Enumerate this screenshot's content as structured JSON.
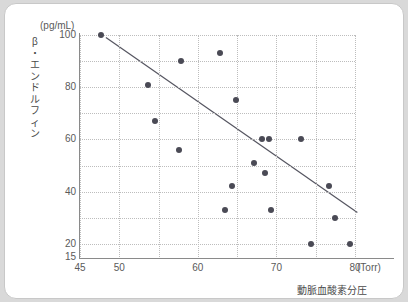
{
  "chart_data": {
    "type": "scatter",
    "title": "",
    "xlabel": "動脈血酸素分圧",
    "xunit": "(Torr)",
    "ylabel": "β・エンドルフィン",
    "yunit": "(pg/mL)",
    "xlim": [
      45,
      80
    ],
    "ylim": [
      15,
      100
    ],
    "xticks": [
      45,
      50,
      60,
      70,
      80
    ],
    "yticks": [
      15,
      20,
      40,
      60,
      80,
      100
    ],
    "xgrid_values": [
      45,
      50,
      55,
      60,
      65,
      70,
      75,
      80
    ],
    "ygrid_values": [
      20,
      30,
      40,
      50,
      60,
      70,
      80,
      90,
      100
    ],
    "grid": true,
    "legend": "none",
    "point_color": "#4a4a55",
    "line_color": "#555560",
    "points": [
      {
        "x": 47.7,
        "y": 100
      },
      {
        "x": 53.6,
        "y": 81
      },
      {
        "x": 54.6,
        "y": 67
      },
      {
        "x": 57.8,
        "y": 90
      },
      {
        "x": 57.6,
        "y": 56
      },
      {
        "x": 62.8,
        "y": 93
      },
      {
        "x": 64.8,
        "y": 75
      },
      {
        "x": 64.3,
        "y": 42
      },
      {
        "x": 63.5,
        "y": 33
      },
      {
        "x": 67.1,
        "y": 51
      },
      {
        "x": 68.2,
        "y": 60
      },
      {
        "x": 69.0,
        "y": 60
      },
      {
        "x": 68.5,
        "y": 47
      },
      {
        "x": 69.3,
        "y": 33
      },
      {
        "x": 73.1,
        "y": 60
      },
      {
        "x": 74.4,
        "y": 20
      },
      {
        "x": 76.7,
        "y": 42
      },
      {
        "x": 77.5,
        "y": 30
      },
      {
        "x": 79.4,
        "y": 20
      }
    ],
    "regression_line": {
      "x1": 48.3,
      "y1": 99.0,
      "x2": 80.3,
      "y2": 32.0
    }
  }
}
